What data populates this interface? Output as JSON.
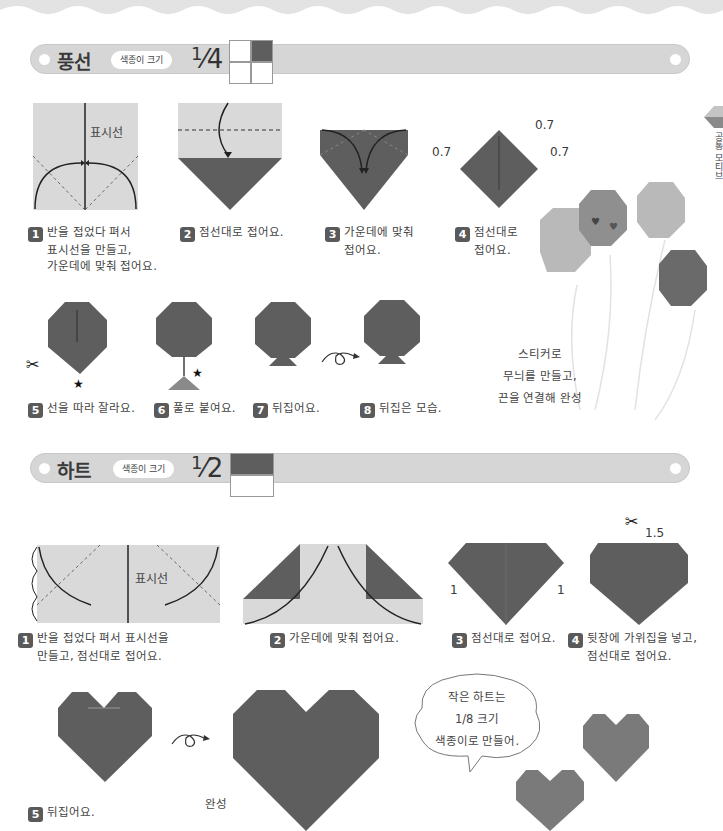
{
  "sections": [
    {
      "title": "풍선",
      "paper_size_label": "색종이 크기",
      "fraction": {
        "numerator": "1",
        "denominator": "4"
      },
      "steps": [
        {
          "number": "1",
          "lines": [
            "반을 접었다 펴서",
            "표시선을 만들고,",
            "가운데에 맞춰 접어요."
          ],
          "diagram_label": "표시선"
        },
        {
          "number": "2",
          "lines": [
            "점선대로 접어요."
          ]
        },
        {
          "number": "3",
          "lines": [
            "가운데에 맞춰",
            "접어요."
          ]
        },
        {
          "number": "4",
          "lines": [
            "점선대로",
            "접어요."
          ],
          "measures": [
            "0.7",
            "0.7",
            "0.7"
          ]
        },
        {
          "number": "5",
          "lines": [
            "선을 따라 잘라요."
          ]
        },
        {
          "number": "6",
          "lines": [
            "풀로 붙여요."
          ]
        },
        {
          "number": "7",
          "lines": [
            "뒤집어요."
          ]
        },
        {
          "number": "8",
          "lines": [
            "뒤집은 모습."
          ]
        }
      ],
      "note": [
        "스티커로",
        "무늬를 만들고,",
        "끈을 연결해 완성"
      ]
    },
    {
      "title": "하트",
      "paper_size_label": "색종이 크기",
      "fraction": {
        "numerator": "1",
        "denominator": "2"
      },
      "steps": [
        {
          "number": "1",
          "lines": [
            "반을 접었다 펴서 표시선을",
            "만들고, 점선대로 접어요."
          ],
          "diagram_label": "표시선"
        },
        {
          "number": "2",
          "lines": [
            "가운데에 맞춰 접어요."
          ]
        },
        {
          "number": "3",
          "lines": [
            "점선대로 접어요."
          ],
          "measures": [
            "1",
            "1"
          ]
        },
        {
          "number": "4",
          "lines": [
            "뒷장에 가위집을 넣고,",
            "점선대로 접어요."
          ],
          "measures": [
            "1.5"
          ]
        },
        {
          "number": "5",
          "lines": [
            "뒤집어요."
          ]
        }
      ],
      "complete_label": "완성",
      "speech_bubble": [
        "작은 하트는",
        "1/8 크기",
        "색종이로 만들어."
      ]
    }
  ],
  "side_tab": "공통 모티브",
  "colors": {
    "paper_dark": "#5e5e5e",
    "paper_light": "#d9d9d9",
    "band": "#d6d6d6",
    "balloon_light": "#b9b9b9",
    "balloon_mid": "#8f8f8f"
  }
}
